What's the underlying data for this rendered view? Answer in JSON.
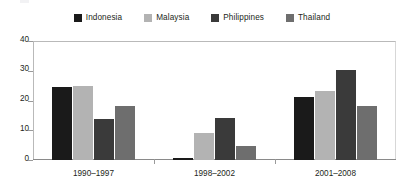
{
  "chart_data": {
    "type": "bar",
    "title": "",
    "subtitle": "",
    "xlabel": "",
    "ylabel": "",
    "categories": [
      "1990–1997",
      "1998–2002",
      "2001–2008"
    ],
    "series": [
      {
        "name": "Indonesia",
        "color": "#1a1a1a",
        "values": [
          24.5,
          0.8,
          21.2
        ]
      },
      {
        "name": "Malaysia",
        "color": "#b3b3b3",
        "values": [
          25.0,
          9.0,
          23.2
        ]
      },
      {
        "name": "Philippines",
        "color": "#3a3a3a",
        "values": [
          13.8,
          14.2,
          30.3
        ]
      },
      {
        "name": "Thailand",
        "color": "#6e6e6e",
        "values": [
          18.2,
          4.8,
          18.0
        ]
      }
    ],
    "ylim": [
      0,
      40
    ],
    "yticks": [
      0,
      10,
      20,
      30,
      40
    ],
    "ytick_labels": [
      "0",
      "10",
      "20",
      "30",
      "40"
    ],
    "grid": false,
    "legend_position": "top"
  },
  "legend": {
    "entries": [
      {
        "label": "Indonesia"
      },
      {
        "label": "Malaysia"
      },
      {
        "label": "Philippines"
      },
      {
        "label": "Thailand"
      }
    ]
  },
  "axis": {
    "y_labels": [
      "40",
      "30",
      "20",
      "10",
      "0"
    ],
    "x_labels": [
      "1990–1997",
      "1998–2002",
      "2001–2008"
    ]
  }
}
